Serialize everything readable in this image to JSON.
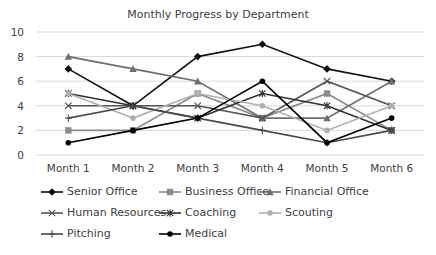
{
  "chart_data": {
    "type": "line",
    "title": "Monthly Progress by Department",
    "xlabel": "",
    "ylabel": "",
    "categories": [
      "Month 1",
      "Month 2",
      "Month 3",
      "Month 4",
      "Month 5",
      "Month 6"
    ],
    "ylim": [
      0,
      10
    ],
    "yticks": [
      0,
      2,
      4,
      6,
      8,
      10
    ],
    "grid": true,
    "legend_position": "bottom",
    "series": [
      {
        "name": "Senior Office",
        "values": [
          7,
          4,
          8,
          9,
          7,
          6
        ],
        "color": "#111111",
        "marker": "diamond"
      },
      {
        "name": "Business Office",
        "values": [
          2,
          2,
          5,
          3,
          5,
          2
        ],
        "color": "#8c8c8c",
        "marker": "square"
      },
      {
        "name": "Financial Office",
        "values": [
          8,
          7,
          6,
          3,
          3,
          6
        ],
        "color": "#6e6e6e",
        "marker": "triangle"
      },
      {
        "name": "Human Resources",
        "values": [
          4,
          4,
          4,
          3,
          6,
          4
        ],
        "color": "#555555",
        "marker": "x"
      },
      {
        "name": "Coaching",
        "values": [
          5,
          4,
          3,
          5,
          4,
          2
        ],
        "color": "#333333",
        "marker": "asterisk"
      },
      {
        "name": "Scouting",
        "values": [
          5,
          3,
          5,
          4,
          2,
          4
        ],
        "color": "#b0b0b0",
        "marker": "circle"
      },
      {
        "name": "Pitching",
        "values": [
          3,
          4,
          3,
          2,
          1,
          2
        ],
        "color": "#4a4a4a",
        "marker": "plus"
      },
      {
        "name": "Medical",
        "values": [
          1,
          2,
          3,
          6,
          1,
          3
        ],
        "color": "#000000",
        "marker": "circle"
      }
    ]
  }
}
